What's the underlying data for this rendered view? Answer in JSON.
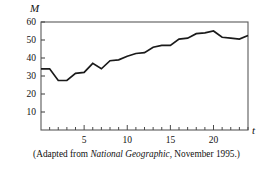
{
  "figure": {
    "ylabel": "M",
    "xlabel": "t",
    "caption_prefix": "(Adapted from ",
    "caption_italic": "National Geographic",
    "caption_suffix": ", November 1995.)"
  },
  "chart_data": {
    "type": "line",
    "title": "",
    "xlabel": "t",
    "ylabel": "M",
    "xlim": [
      0,
      24
    ],
    "ylim": [
      0,
      60
    ],
    "grid": false,
    "legend": null,
    "x_ticks_labeled": [
      5,
      10,
      15,
      20
    ],
    "y_ticks_labeled": [
      10,
      20,
      30,
      40,
      50,
      60
    ],
    "x_tick_step_minor": 1,
    "line_color": "#1a1a1a",
    "series": [
      {
        "name": "M",
        "x": [
          0,
          1,
          2,
          3,
          4,
          5,
          6,
          7,
          8,
          9,
          10,
          11,
          12,
          13,
          14,
          15,
          16,
          17,
          18,
          19,
          20,
          21,
          22,
          23,
          24
        ],
        "values": [
          34,
          34,
          27.5,
          27.5,
          31.5,
          32,
          37,
          34,
          38.5,
          39,
          41,
          42.5,
          43,
          46,
          47,
          47,
          50.5,
          51,
          53.5,
          54,
          55,
          51.5,
          51,
          50.5,
          52.5
        ]
      }
    ]
  }
}
